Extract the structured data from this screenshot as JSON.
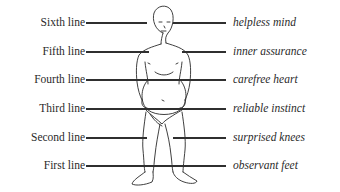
{
  "diagram": {
    "lines": [
      {
        "label": "Sixth line",
        "meaning": "helpless mind",
        "y": 22
      },
      {
        "label": "Fifth line",
        "meaning": "inner assurance",
        "y": 51
      },
      {
        "label": "Fourth line",
        "meaning": "carefree heart",
        "y": 79
      },
      {
        "label": "Third line",
        "meaning": "reliable instinct",
        "y": 108
      },
      {
        "label": "Second line",
        "meaning": "surprised knees",
        "y": 137
      },
      {
        "label": "First line",
        "meaning": "observant feet",
        "y": 165
      }
    ],
    "figure": "standing-human-figure"
  }
}
